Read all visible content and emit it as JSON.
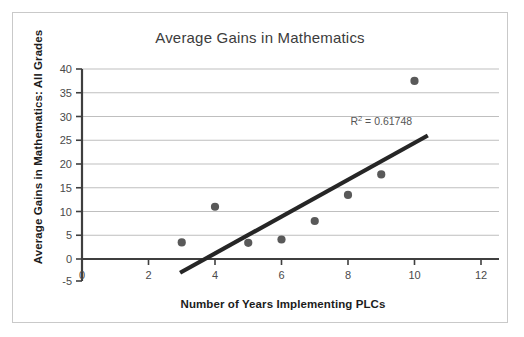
{
  "chart_data": {
    "type": "scatter",
    "title": "Average Gains in Mathematics",
    "xlabel": "Number of Years Implementing PLCs",
    "ylabel": "Average Gains in Mathematics: All Grades",
    "xlim": [
      0,
      12
    ],
    "ylim": [
      -5,
      40
    ],
    "xticks": [
      0,
      2,
      4,
      6,
      8,
      10,
      12
    ],
    "yticks": [
      -5,
      0,
      5,
      10,
      15,
      20,
      25,
      30,
      35,
      40
    ],
    "xtick_labels": [
      "0",
      "2",
      "4",
      "6",
      "8",
      "10",
      "12"
    ],
    "ytick_labels": [
      "-5",
      "0",
      "5",
      "10",
      "15",
      "20",
      "25",
      "30",
      "35",
      "40"
    ],
    "grid": "horizontal",
    "legend": "none",
    "x": [
      3,
      4,
      5,
      6,
      7,
      8,
      9,
      10
    ],
    "y": [
      3.5,
      11,
      3.4,
      4.1,
      8,
      13.5,
      17.8,
      37.5
    ],
    "points": [
      {
        "x": 3,
        "y": 3.5
      },
      {
        "x": 4,
        "y": 11
      },
      {
        "x": 5,
        "y": 3.4
      },
      {
        "x": 6,
        "y": 4.1
      },
      {
        "x": 7,
        "y": 8
      },
      {
        "x": 8,
        "y": 13.5
      },
      {
        "x": 9,
        "y": 17.8
      },
      {
        "x": 10,
        "y": 37.5
      }
    ],
    "trendline": {
      "x_start": 2.95,
      "y_start": -2.9,
      "x_end": 10.4,
      "y_end": 26.0
    },
    "annotations": [
      {
        "text_prefix": "R",
        "text_sup": "2",
        "text_suffix": " = 0.61748",
        "full_text": "R2 = 0.61748",
        "x": 9.0,
        "y": 28.3
      }
    ],
    "r_squared": 0.61748,
    "colors": {
      "marker": "#595959",
      "trendline": "#262626",
      "gridline": "#bfbfbf",
      "axis": "#3f3f3f",
      "title_text": "#3c3c3c",
      "label_text": "#1c1c1c",
      "tick_text": "#4a4a4a",
      "annotation_text": "#555555",
      "frame_border": "#c9c9c9",
      "background": "#ffffff"
    }
  }
}
